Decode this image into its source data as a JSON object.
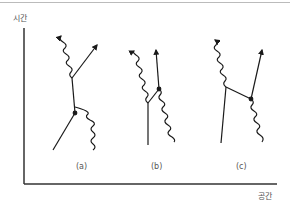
{
  "figure": {
    "type": "spacetime-feynman-diagram",
    "axes": {
      "y_label": "시간",
      "x_label": "공간"
    },
    "panels": [
      {
        "id": "a",
        "label": "(a)"
      },
      {
        "id": "b",
        "label": "(b)"
      },
      {
        "id": "c",
        "label": "(c)"
      }
    ],
    "legend": {
      "straight_line": "electron",
      "wavy_line": "photon"
    },
    "colors": {
      "line": "#1a1a1a",
      "axis": "#333333",
      "text": "#555555",
      "top_rule": "#bbbbbb"
    }
  }
}
